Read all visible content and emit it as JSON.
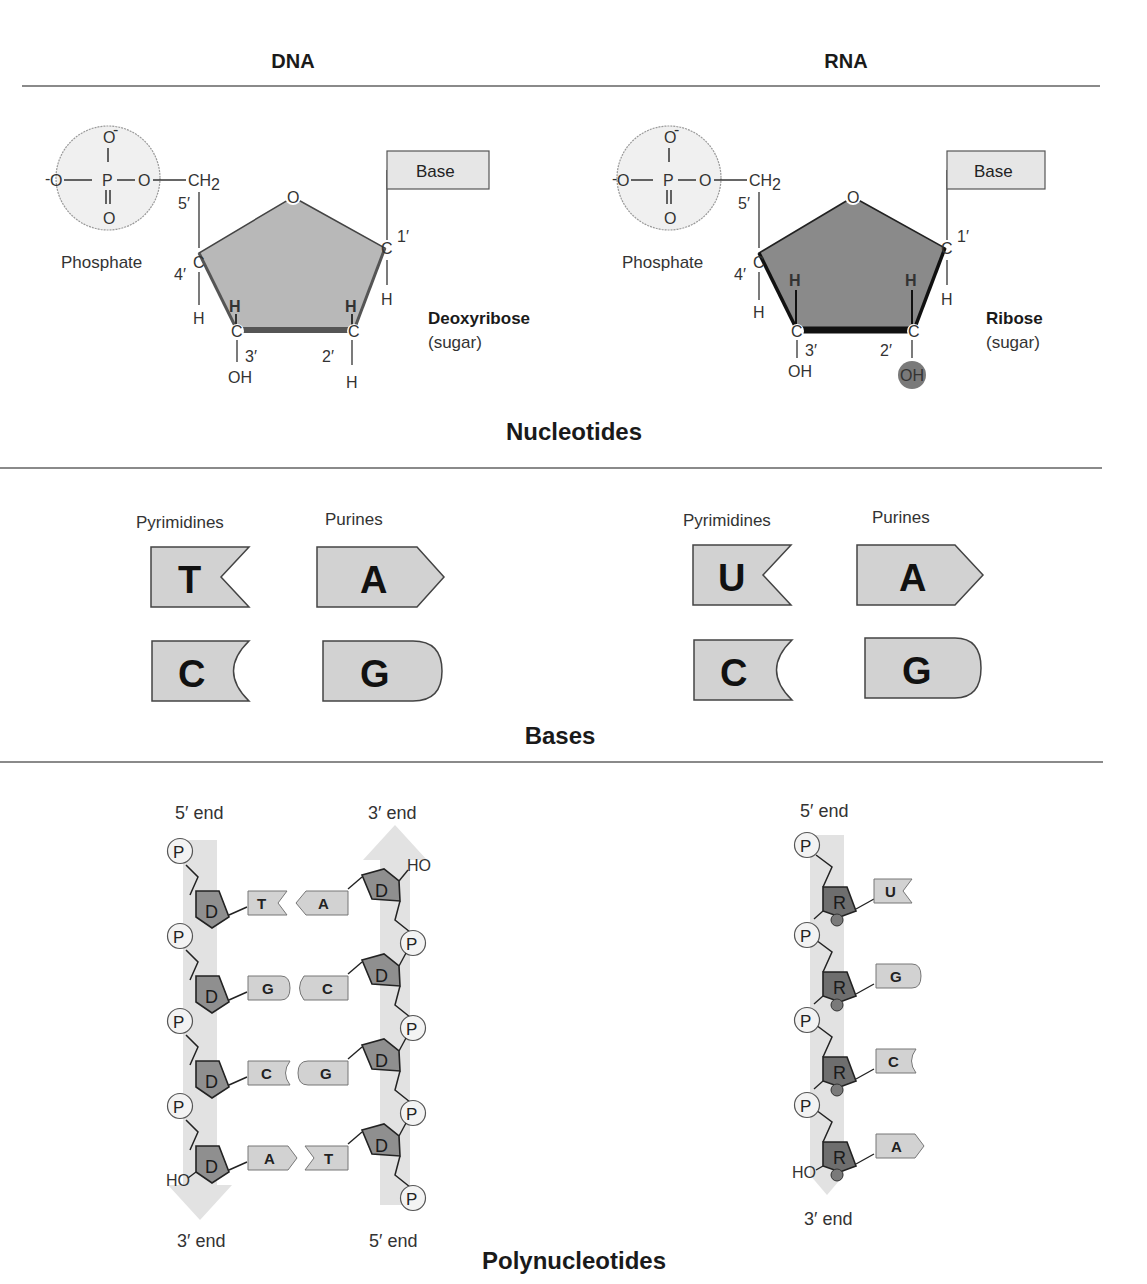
{
  "columns": {
    "left": "DNA",
    "right": "RNA"
  },
  "sections": {
    "nucleotides": "Nucleotides",
    "bases": "Bases",
    "polynucleotides": "Polynucleotides"
  },
  "nucleotide": {
    "phosphate_label": "Phosphate",
    "o_minus_top": "O",
    "o_minus_left": "O",
    "p": "P",
    "o_bridge": "O",
    "o_double": "O",
    "ch2": "CH",
    "ch2_sub": "2",
    "ring_o": "O",
    "carbon": "C",
    "hydrogen": "H",
    "hydroxyl": "OH",
    "base_label": "Base",
    "positions": {
      "c1": "1′",
      "c2": "2′",
      "c3": "3′",
      "c4": "4′",
      "c5": "5′"
    },
    "dna_sugar_name": "Deoxyribose",
    "rna_sugar_name": "Ribose",
    "sugar_note": "(sugar)"
  },
  "bases": {
    "pyrimidines_label": "Pyrimidines",
    "purines_label": "Purines",
    "dna": {
      "pyrimidines": [
        "T",
        "C"
      ],
      "purines": [
        "A",
        "G"
      ]
    },
    "rna": {
      "pyrimidines": [
        "U",
        "C"
      ],
      "purines": [
        "A",
        "G"
      ]
    }
  },
  "polynucleotides": {
    "five_prime_end": "5′ end",
    "three_prime_end": "3′ end",
    "phosphate_symbol": "P",
    "deoxyribose_symbol": "D",
    "ribose_symbol": "R",
    "hydroxyl_end": "HO",
    "dna_pairs": [
      {
        "left": "T",
        "right": "A"
      },
      {
        "left": "G",
        "right": "C"
      },
      {
        "left": "C",
        "right": "G"
      },
      {
        "left": "A",
        "right": "T"
      }
    ],
    "rna_bases": [
      "U",
      "G",
      "C",
      "A"
    ]
  },
  "colors": {
    "sugar_dna": "#b8b8b8",
    "sugar_rna": "#8a8a8a",
    "base_fill": "#d2d2d2",
    "phosphate_fill": "#f0f0f0",
    "strand_band": "#e2e2e2",
    "divider": "#8a8a8a"
  }
}
